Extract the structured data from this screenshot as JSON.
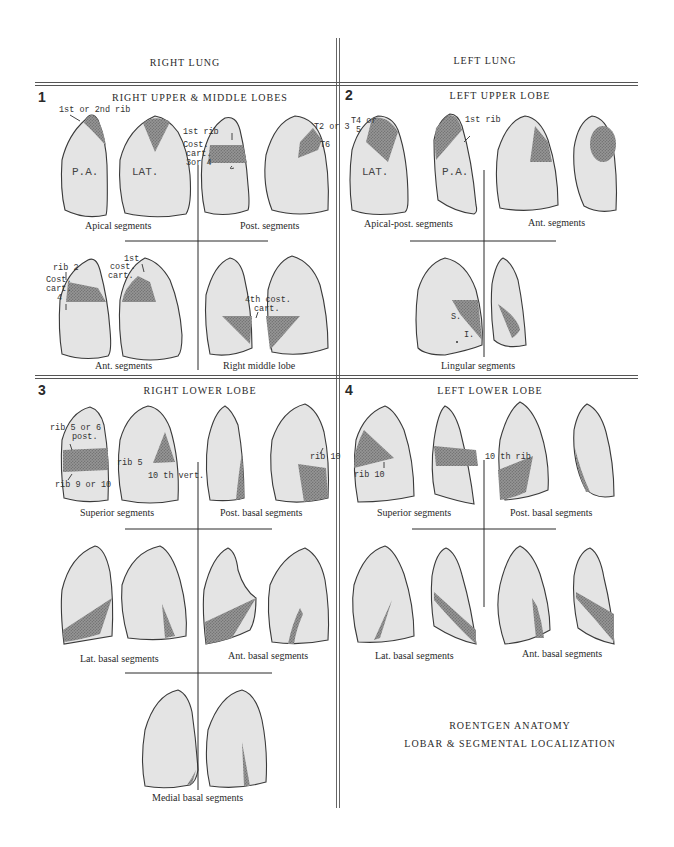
{
  "columns": {
    "right": "RIGHT LUNG",
    "left": "LEFT LUNG"
  },
  "sections": [
    {
      "number": "1",
      "title": "RIGHT UPPER & MIDDLE LOBES",
      "captions": [
        "Apical segments",
        "Post. segments",
        "Ant. segments",
        "Right middle lobe"
      ],
      "labels": {
        "rib_1_or_2": "1st or 2nd rib",
        "pa": "P.A.",
        "lat": "LAT.",
        "first_rib": "1st rib",
        "cost_cart": "Cost.",
        "cart": "cart.",
        "three_or_4": "3or 4",
        "t2_or_3": "T2 or 3",
        "t6": "T6",
        "rib2": "rib 2",
        "cost2": "Cost.",
        "cart2": "cart.",
        "four": "4",
        "first_cost_1": "1st",
        "first_cost_2": "cost.",
        "first_cost_3": "cart.",
        "fourth_cost_1": "4th cost.",
        "fourth_cost_2": "cart."
      }
    },
    {
      "number": "2",
      "title": "LEFT UPPER LOBE",
      "captions": [
        "Apical-post. segments",
        "Ant. segments",
        "Lingular segments"
      ],
      "labels": {
        "t4_or": "T4 or",
        "five": "5",
        "lat": "LAT.",
        "pa": "P.A.",
        "first_rib": "1st rib",
        "s": "S.",
        "i": "I."
      }
    },
    {
      "number": "3",
      "title": "RIGHT LOWER LOBE",
      "captions": [
        "Superior segments",
        "Post. basal segments",
        "Lat. basal segments",
        "Ant. basal segments",
        "Medial basal segments"
      ],
      "labels": {
        "rib5or6": "rib 5 or 6",
        "post": "post.",
        "rib9or10": "rib 9 or 10",
        "rib5": "rib 5",
        "tenth_vert": "10 th vert.",
        "rib10": "rib 10"
      }
    },
    {
      "number": "4",
      "title": "LEFT LOWER LOBE",
      "captions": [
        "Superior segments",
        "Post. basal segments",
        "Lat. basal segments",
        "Ant. basal segments"
      ],
      "labels": {
        "rib10": "rib 10",
        "tenth_rib": "10 th rib"
      }
    }
  ],
  "footer": {
    "line1": "ROENTGEN ANATOMY",
    "line2": "LOBAR & SEGMENTAL LOCALIZATION"
  },
  "colors": {
    "lung_fill": "#e4e4e4",
    "segment_shade": "#8c8c8c",
    "outline": "#3a3a3a",
    "rule": "#555555"
  }
}
